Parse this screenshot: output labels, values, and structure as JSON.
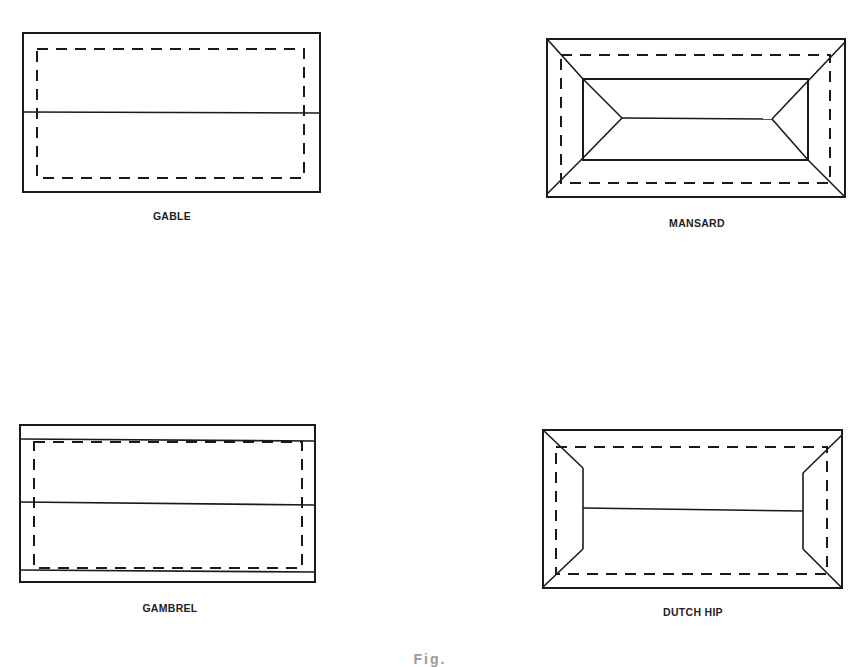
{
  "figure": {
    "caption_truncated": "Fig. ",
    "line_color": "#1a1a1a",
    "panels": [
      {
        "id": "gable",
        "label": "GABLE",
        "label_pos": {
          "x": 172,
          "y": 210
        },
        "outer": {
          "x": 23,
          "y": 33,
          "w": 297,
          "h": 159
        },
        "dashed": {
          "x": 37,
          "y": 49,
          "w": 267,
          "h": 129
        },
        "lines": [
          {
            "x1": 23,
            "y1": 112,
            "x2": 320,
            "y2": 113
          }
        ]
      },
      {
        "id": "mansard",
        "label": "MANSARD",
        "label_pos": {
          "x": 697,
          "y": 217
        },
        "outer": {
          "x": 547,
          "y": 39,
          "w": 298,
          "h": 158
        },
        "dashed": {
          "x": 561,
          "y": 55,
          "w": 269,
          "h": 128
        },
        "inner": {
          "x": 583,
          "y": 79,
          "w": 225,
          "h": 81
        },
        "lines": [
          {
            "x1": 547,
            "y1": 39,
            "x2": 583,
            "y2": 79
          },
          {
            "x1": 845,
            "y1": 42,
            "x2": 808,
            "y2": 81
          },
          {
            "x1": 547,
            "y1": 194,
            "x2": 583,
            "y2": 158
          },
          {
            "x1": 845,
            "y1": 197,
            "x2": 808,
            "y2": 160
          },
          {
            "x1": 583,
            "y1": 79,
            "x2": 622,
            "y2": 118
          },
          {
            "x1": 583,
            "y1": 158,
            "x2": 622,
            "y2": 118
          },
          {
            "x1": 622,
            "y1": 118,
            "x2": 772,
            "y2": 119
          },
          {
            "x1": 772,
            "y1": 119,
            "x2": 808,
            "y2": 81
          },
          {
            "x1": 772,
            "y1": 119,
            "x2": 808,
            "y2": 160
          }
        ]
      },
      {
        "id": "gambrel",
        "label": "GAMBREL",
        "label_pos": {
          "x": 170,
          "y": 602
        },
        "outer": {
          "x": 20,
          "y": 425,
          "w": 295,
          "h": 157
        },
        "dashed": {
          "x": 34,
          "y": 442,
          "w": 268,
          "h": 126
        },
        "lines": [
          {
            "x1": 20,
            "y1": 439,
            "x2": 315,
            "y2": 441
          },
          {
            "x1": 20,
            "y1": 570,
            "x2": 315,
            "y2": 572
          },
          {
            "x1": 20,
            "y1": 502,
            "x2": 315,
            "y2": 505
          }
        ]
      },
      {
        "id": "dutch_hip",
        "label": "DUTCH HIP",
        "label_pos": {
          "x": 693,
          "y": 606
        },
        "outer": {
          "x": 543,
          "y": 430,
          "w": 299,
          "h": 158
        },
        "dashed": {
          "x": 556,
          "y": 447,
          "w": 271,
          "h": 127
        },
        "lines": [
          {
            "x1": 543,
            "y1": 430,
            "x2": 583,
            "y2": 468
          },
          {
            "x1": 583,
            "y1": 468,
            "x2": 583,
            "y2": 549
          },
          {
            "x1": 583,
            "y1": 549,
            "x2": 543,
            "y2": 587
          },
          {
            "x1": 842,
            "y1": 435,
            "x2": 803,
            "y2": 473
          },
          {
            "x1": 803,
            "y1": 473,
            "x2": 803,
            "y2": 549
          },
          {
            "x1": 803,
            "y1": 549,
            "x2": 842,
            "y2": 588
          },
          {
            "x1": 583,
            "y1": 508,
            "x2": 803,
            "y2": 511
          }
        ]
      }
    ]
  }
}
